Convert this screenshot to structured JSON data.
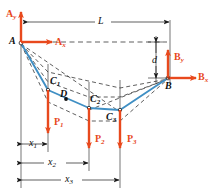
{
  "figure": {
    "type": "cable-structure-free-body-diagram",
    "colors": {
      "cable": "#3f8fc4",
      "force": "#e8491d",
      "construction": "#1a1a1a",
      "background": "#ffffff"
    },
    "supports": [
      {
        "id": "A",
        "label": "A",
        "x": 21,
        "y": 42
      },
      {
        "id": "B",
        "label": "B",
        "x": 168,
        "y": 78
      }
    ],
    "reactions": [
      {
        "id": "Ay",
        "label": "A",
        "sub": "y",
        "direction": "up",
        "at_x": 21,
        "at_y": 42
      },
      {
        "id": "Ax",
        "label": "A",
        "sub": "x",
        "direction": "right",
        "at_x": 21,
        "at_y": 42
      },
      {
        "id": "By",
        "label": "B",
        "sub": "y",
        "direction": "up",
        "at_x": 168,
        "at_y": 78
      },
      {
        "id": "Bx",
        "label": "B",
        "sub": "x",
        "direction": "right",
        "at_x": 168,
        "at_y": 78
      }
    ],
    "cable_points": [
      {
        "id": "C1",
        "label": "C",
        "sub": "1",
        "x": 48,
        "y": 90
      },
      {
        "id": "C2",
        "label": "C",
        "sub": "2",
        "x": 89,
        "y": 108
      },
      {
        "id": "C3",
        "label": "C",
        "sub": "3",
        "x": 120,
        "y": 110
      }
    ],
    "interior_point": {
      "id": "D",
      "label": "D",
      "x": 66,
      "y": 99
    },
    "loads": [
      {
        "id": "P1",
        "label": "P",
        "sub": "1",
        "x": 48,
        "from_y": 90,
        "to_y": 133
      },
      {
        "id": "P2",
        "label": "P",
        "sub": "2",
        "x": 89,
        "from_y": 108,
        "to_y": 148
      },
      {
        "id": "P3",
        "label": "P",
        "sub": "3",
        "x": 120,
        "from_y": 110,
        "to_y": 148
      }
    ],
    "dimensions": [
      {
        "id": "L",
        "label": "L",
        "sub": "",
        "orientation": "horizontal",
        "from": 23,
        "to": 170,
        "at": 22
      },
      {
        "id": "d",
        "label": "d",
        "sub": "",
        "orientation": "vertical",
        "from": 42,
        "to": 78,
        "at": 156
      },
      {
        "id": "x1",
        "label": "x",
        "sub": "1",
        "orientation": "horizontal",
        "from": 21,
        "to": 48,
        "at": 144
      },
      {
        "id": "x2",
        "label": "x",
        "sub": "2",
        "orientation": "horizontal",
        "from": 21,
        "to": 89,
        "at": 163
      },
      {
        "id": "x3",
        "label": "x",
        "sub": "3",
        "orientation": "horizontal",
        "from": 21,
        "to": 120,
        "at": 180
      }
    ]
  }
}
